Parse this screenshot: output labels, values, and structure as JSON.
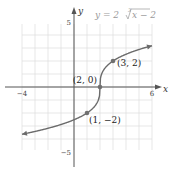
{
  "chart_data": {
    "type": "line",
    "title": "",
    "equation_label": "y = 2∛(x − 2)",
    "equation_display": {
      "prefix": "y = 2",
      "radical_index": "3",
      "radicand": "x − 2"
    },
    "xlabel": "x",
    "ylabel": "y",
    "xlim": [
      -4,
      6
    ],
    "ylim": [
      -5,
      5
    ],
    "grid": true,
    "x_ticks_labeled": [
      {
        "value": -4,
        "label": "−4"
      },
      {
        "value": 6,
        "label": "6"
      }
    ],
    "y_ticks_labeled": [
      {
        "value": 5,
        "label": "5"
      },
      {
        "value": -5,
        "label": "−5"
      }
    ],
    "function": "2*cbrt(x-2)",
    "domain_plotted": [
      -4,
      6
    ],
    "arrows_both_ends": true,
    "highlighted_points": [
      {
        "x": 1,
        "y": -2,
        "label": "(1, −2)"
      },
      {
        "x": 2,
        "y": 0,
        "label": "(2, 0)"
      },
      {
        "x": 3,
        "y": 2,
        "label": "(3, 2)"
      }
    ],
    "colors": {
      "curve": "#6b6b6b",
      "axis": "#555555",
      "grid": "#dcdcdc",
      "point": "#707070"
    }
  }
}
